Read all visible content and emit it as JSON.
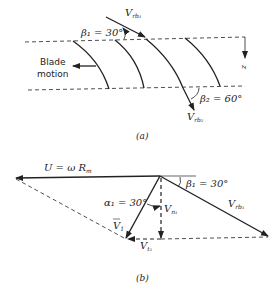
{
  "panel_a": {
    "caption": "(a)",
    "beta1_label": "β₁ = 30°",
    "beta2_label": "β₂ = 60°",
    "vrb1_label": "V",
    "vrb1_sub": "rb₁",
    "vrb2_label": "V",
    "vrb2_sub": "rb₂",
    "blade_motion_line1": "Blade",
    "blade_motion_line2": "motion",
    "z_label": "z"
  },
  "panel_b": {
    "caption": "(b)",
    "u_label": "U = ω R",
    "u_sub": "m",
    "beta1_label": "β₁ = 30°",
    "alpha1_label": "α₁ = 30°",
    "v1_label": "V",
    "v1_sub": "1",
    "vn1_label": "V",
    "vn1_sub": "n₁",
    "vt1_label": "V",
    "vt1_sub": "t₁",
    "vrb1_label": "V",
    "vrb1_sub": "rb₁"
  },
  "colors": {
    "line": "#222222",
    "background": "#ffffff"
  }
}
